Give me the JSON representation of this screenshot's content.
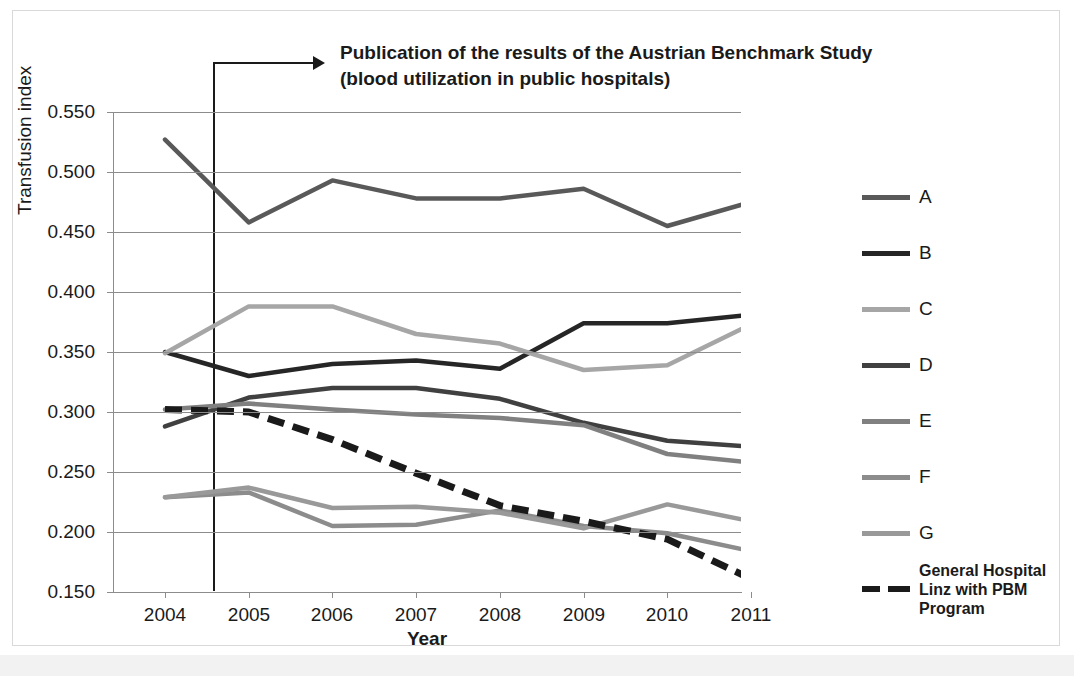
{
  "chart_data": {
    "type": "line",
    "title": "",
    "xlabel": "Year",
    "ylabel": "Transfusion index",
    "x": [
      2004,
      2005,
      2006,
      2007,
      2008,
      2009,
      2010,
      2011
    ],
    "xtick_labels": [
      "2004",
      "2005",
      "2006",
      "2007",
      "2008",
      "2009",
      "2010",
      "2011"
    ],
    "ytick_labels": [
      "0.550",
      "0.500",
      "0.450",
      "0.400",
      "0.350",
      "0.300",
      "0.250",
      "0.200",
      "0.150"
    ],
    "ytick_values": [
      0.55,
      0.5,
      0.45,
      0.4,
      0.35,
      0.3,
      0.25,
      0.2,
      0.15
    ],
    "ylim": [
      0.15,
      0.55
    ],
    "grid": "horizontal",
    "legend_position": "right",
    "series": [
      {
        "name": "A",
        "color": "#595959",
        "style": "solid",
        "values": [
          0.527,
          0.458,
          0.493,
          0.478,
          0.478,
          0.486,
          0.455,
          0.475
        ]
      },
      {
        "name": "B",
        "color": "#262626",
        "style": "solid",
        "values": [
          0.35,
          0.33,
          0.34,
          0.343,
          0.336,
          0.374,
          0.374,
          0.381
        ]
      },
      {
        "name": "C",
        "color": "#a6a6a6",
        "style": "solid",
        "values": [
          0.349,
          0.388,
          0.388,
          0.365,
          0.357,
          0.335,
          0.339,
          0.373
        ]
      },
      {
        "name": "D",
        "color": "#404040",
        "style": "solid",
        "values": [
          0.288,
          0.312,
          0.32,
          0.32,
          0.311,
          0.291,
          0.276,
          0.271
        ]
      },
      {
        "name": "E",
        "color": "#808080",
        "style": "solid",
        "values": [
          0.302,
          0.307,
          0.302,
          0.298,
          0.295,
          0.289,
          0.265,
          0.258
        ]
      },
      {
        "name": "F",
        "color": "#8c8c8c",
        "style": "solid",
        "values": [
          0.229,
          0.233,
          0.205,
          0.206,
          0.218,
          0.205,
          0.199,
          0.184
        ]
      },
      {
        "name": "G",
        "color": "#999999",
        "style": "solid",
        "values": [
          0.229,
          0.237,
          0.22,
          0.221,
          0.216,
          0.203,
          0.223,
          0.209
        ]
      },
      {
        "name": "General Hospital Linz with PBM Program",
        "color": "#1a1a1a",
        "style": "dashed",
        "values": [
          0.302,
          0.3,
          0.277,
          0.249,
          0.222,
          0.209,
          0.194,
          0.161
        ]
      }
    ],
    "annotation": {
      "line1": "Publication of the results of the Austrian Benchmark Study",
      "line2": "(blood utilization in public hospitals)",
      "marker_x": 2004.5,
      "marker_description": "vertical line with arrow pointing to annotation text"
    }
  },
  "legend": {
    "items": [
      {
        "label": "A",
        "color": "#595959",
        "style": "solid"
      },
      {
        "label": "B",
        "color": "#262626",
        "style": "solid"
      },
      {
        "label": "C",
        "color": "#a6a6a6",
        "style": "solid"
      },
      {
        "label": "D",
        "color": "#404040",
        "style": "solid"
      },
      {
        "label": "E",
        "color": "#808080",
        "style": "solid"
      },
      {
        "label": "F",
        "color": "#8c8c8c",
        "style": "solid"
      },
      {
        "label": "G",
        "color": "#999999",
        "style": "solid"
      },
      {
        "label": "General Hospital Linz with PBM Program",
        "color": "#1a1a1a",
        "style": "dashed"
      }
    ]
  },
  "axis": {
    "y_title": "Transfusion index",
    "x_title": "Year"
  },
  "annotation": {
    "line1": "Publication of the results of the Austrian Benchmark Study",
    "line2": "(blood utilization in public hospitals)"
  },
  "colors": {
    "grid": "#8c8c8c",
    "text": "#1a1a1a",
    "frame": "#d9d9d9",
    "background": "#ffffff"
  }
}
